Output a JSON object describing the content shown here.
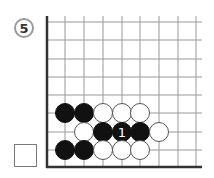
{
  "problem": {
    "number": "5"
  },
  "answer_box": {
    "checked": false
  },
  "board": {
    "columns_x": [
      65,
      84,
      103,
      122,
      140,
      159,
      178,
      196
    ],
    "rows_y": [
      22,
      40,
      59,
      77,
      95,
      113,
      132,
      150
    ],
    "edge_left_x": 47,
    "edge_bottom_y": 167,
    "grid_right_x": 202,
    "grid_top_y": 16,
    "line_color": "#999999",
    "edge_color": "#333333",
    "stone_radius": 9.5,
    "stones": [
      {
        "color": "black",
        "x": 65,
        "y": 113
      },
      {
        "color": "black",
        "x": 84,
        "y": 113
      },
      {
        "color": "white",
        "x": 103,
        "y": 113
      },
      {
        "color": "white",
        "x": 122,
        "y": 113
      },
      {
        "color": "white",
        "x": 140,
        "y": 113
      },
      {
        "color": "white",
        "x": 84,
        "y": 132
      },
      {
        "color": "black",
        "x": 103,
        "y": 132
      },
      {
        "color": "black",
        "x": 122,
        "y": 132,
        "label": "1"
      },
      {
        "color": "black",
        "x": 140,
        "y": 132
      },
      {
        "color": "white",
        "x": 159,
        "y": 132
      },
      {
        "color": "black",
        "x": 65,
        "y": 150
      },
      {
        "color": "black",
        "x": 84,
        "y": 150
      },
      {
        "color": "white",
        "x": 103,
        "y": 150
      },
      {
        "color": "white",
        "x": 122,
        "y": 150
      },
      {
        "color": "white",
        "x": 140,
        "y": 150
      }
    ]
  }
}
